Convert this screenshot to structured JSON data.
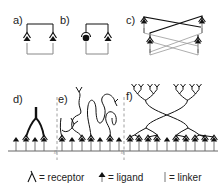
{
  "panels": {
    "a": {
      "label": "a)"
    },
    "b": {
      "label": "b)"
    },
    "c": {
      "label": "c)"
    },
    "d": {
      "label": "d)"
    },
    "e": {
      "label": "e)"
    },
    "f": {
      "label": "f)"
    }
  },
  "legend": {
    "receptor": "= receptor",
    "ligand": "= ligand",
    "linker": "= linker"
  },
  "icons": {
    "receptor": "receptor-icon",
    "ligand": "ligand-icon",
    "linker": "linker-icon"
  },
  "colors": {
    "line": "#111111",
    "gray_line": "#8a8a8a",
    "dashed": "#888888"
  }
}
